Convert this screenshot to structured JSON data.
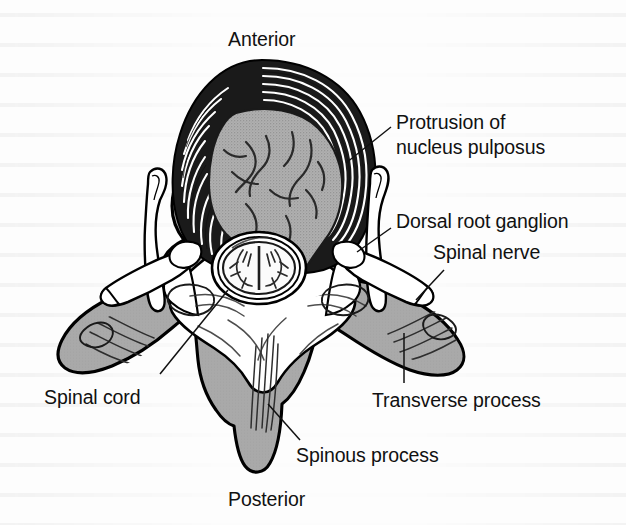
{
  "figure": {
    "background_color": "#fdfdfd",
    "ink_color": "#111111",
    "bone_fill_color": "#a9a9a9",
    "nucleus_fill_color": "#a8a8a8"
  },
  "orientation": {
    "top_label": "Anterior",
    "bottom_label": "Posterior"
  },
  "labels": [
    {
      "id": "protrusion",
      "line1": "Protrusion of",
      "line2": "nucleus pulposus"
    },
    {
      "id": "dorsal-root-ganglion",
      "text": "Dorsal root ganglion"
    },
    {
      "id": "spinal-nerve",
      "text": "Spinal nerve"
    },
    {
      "id": "spinal-cord",
      "text": "Spinal cord"
    },
    {
      "id": "transverse-process",
      "text": "Transverse process"
    },
    {
      "id": "spinous-process",
      "text": "Spinous process"
    }
  ]
}
